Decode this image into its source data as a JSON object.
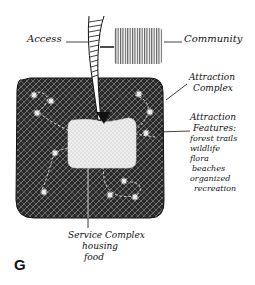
{
  "figure": {
    "letter": "G",
    "colors": {
      "ink": "#111111",
      "background": "#ffffff",
      "attraction_complex_fill": "#2a2a2a",
      "service_complex_fill": "#e8e8e8"
    }
  },
  "labels": {
    "access": "Access",
    "community": "Community",
    "attraction_complex": [
      "Attraction",
      "Complex"
    ],
    "attraction_features": {
      "title": [
        "Attraction",
        "Features:"
      ],
      "items": [
        "forest trails",
        "wildlife",
        "flora",
        "beaches",
        "organized",
        "recreation"
      ]
    },
    "service_complex": {
      "title": "Service Complex",
      "items": [
        "housing",
        "food"
      ]
    }
  },
  "icons": {
    "feature_marker": "asterisk-star-icon",
    "access_arrow": "arrow-down-icon"
  }
}
